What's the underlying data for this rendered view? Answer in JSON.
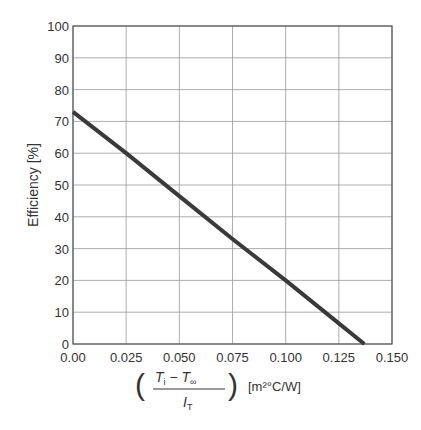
{
  "chart_data": {
    "type": "line",
    "title": "",
    "xlabel": "(T_i − T_∞) / I_T [m²°C/W]",
    "ylabel": "Efficiency [%]",
    "xlim": [
      0.0,
      0.15
    ],
    "ylim": [
      0,
      100
    ],
    "x_ticks": [
      "0.00",
      "0.025",
      "0.050",
      "0.075",
      "0.100",
      "0.125",
      "0.150"
    ],
    "y_ticks": [
      "0",
      "10",
      "20",
      "30",
      "40",
      "50",
      "60",
      "70",
      "80",
      "90",
      "100"
    ],
    "grid": true,
    "legend": null,
    "series": [
      {
        "name": "Efficiency",
        "x": [
          0.0,
          0.025,
          0.05,
          0.075,
          0.1,
          0.125,
          0.137
        ],
        "y": [
          73,
          60,
          46.5,
          33,
          20,
          6.5,
          0
        ]
      }
    ]
  },
  "labels": {
    "ylabel": "Efficiency [%]",
    "x_num_T": "T",
    "x_num_i": "i",
    "x_minus": " − ",
    "x_num_T2": "T",
    "x_num_inf": "∞",
    "x_den_I": "I",
    "x_den_T": "T",
    "x_unit": "[m²°C/W]"
  }
}
